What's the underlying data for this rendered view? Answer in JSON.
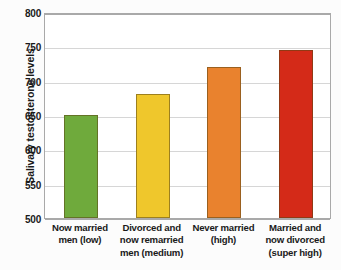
{
  "chart_data": {
    "type": "bar",
    "title": "",
    "xlabel": "",
    "ylabel": "Salivary testosterone levels",
    "ylim": [
      500,
      800
    ],
    "ytick_step": 50,
    "yticks": [
      800,
      750,
      700,
      650,
      600,
      550,
      500
    ],
    "grid": "horizontal",
    "legend": "none",
    "categories": [
      "Now married men (low)",
      "Divorced and now remarried men (medium)",
      "Never married (high)",
      "Married and now divorced (super high)"
    ],
    "category_lines": [
      [
        "Now married",
        "men (low)"
      ],
      [
        "Divorced and",
        "now remarried",
        "men (medium)"
      ],
      [
        "Never married",
        "(high)"
      ],
      [
        "Married and",
        "now divorced",
        "(super high)"
      ]
    ],
    "values": [
      650,
      680,
      720,
      745
    ],
    "bar_colors": [
      "#6FAA3C",
      "#EFC72C",
      "#E9822E",
      "#D42A18"
    ],
    "plot_background": "#ffffff",
    "page_background": "#fcfcfc",
    "grid_color": "#d6d6d6",
    "frame_color": "#a9a9a9"
  }
}
